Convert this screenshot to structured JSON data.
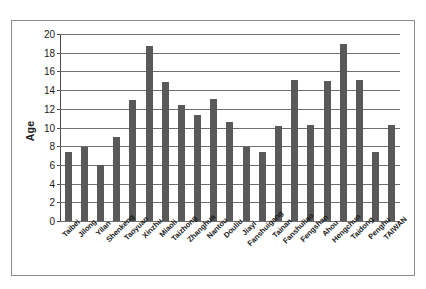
{
  "chart_data": {
    "type": "bar",
    "title": "",
    "xlabel": "",
    "ylabel": "Age",
    "ylim": [
      0,
      20
    ],
    "yticks": [
      0,
      2,
      4,
      6,
      8,
      10,
      12,
      14,
      16,
      18,
      20
    ],
    "grid": true,
    "legend": null,
    "bar_color": "#595959",
    "categories": [
      "Taibei",
      "Jilong",
      "Yilan",
      "Shenkeng",
      "Taoyuan",
      "Xinzhu",
      "Miaoli",
      "Taizhong",
      "Zhanghua",
      "Nantou",
      "Douliu",
      "Jiayi",
      "Fanshuigang",
      "Tainan",
      "Fanshuliao",
      "Fengshan",
      "Ahou",
      "Hengchun",
      "Taidong",
      "Penghu",
      "TAIWAN"
    ],
    "values": [
      7.4,
      7.9,
      6.0,
      9.0,
      12.9,
      18.7,
      14.9,
      12.4,
      11.3,
      13.0,
      10.6,
      7.9,
      7.4,
      10.2,
      15.1,
      10.3,
      15.0,
      18.9,
      15.1,
      7.4,
      10.3
    ]
  }
}
